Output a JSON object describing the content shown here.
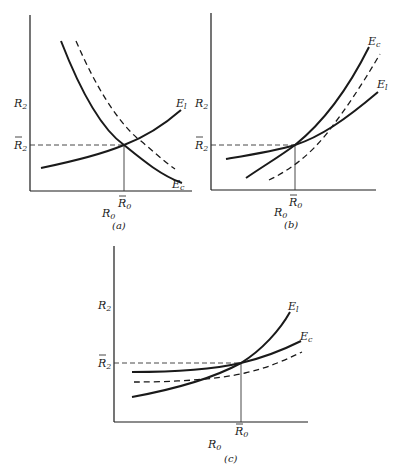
{
  "figure": {
    "panels": [
      {
        "id": "a",
        "caption": "(a)",
        "y_label": "R",
        "y_label_sub": "2",
        "y_tick_label": "R",
        "y_tick_sub": "2",
        "x_tick_label": "R",
        "x_tick_sub": "0",
        "x_label": "R",
        "x_label_sub": "0",
        "curves": [
          {
            "name": "E",
            "sub": "l",
            "style": "solid",
            "shape": "increasing convex"
          },
          {
            "name": "E",
            "sub": "c",
            "style": "solid",
            "shape": "decreasing convex"
          },
          {
            "name": "",
            "sub": "",
            "style": "dashed",
            "shape": "decreasing convex, shifted right of Ec"
          }
        ]
      },
      {
        "id": "b",
        "caption": "(b)",
        "y_label": "R",
        "y_label_sub": "2",
        "y_tick_label": "R",
        "y_tick_sub": "2",
        "x_tick_label": "R",
        "x_tick_sub": "0",
        "x_label": "R",
        "x_label_sub": "0",
        "curves": [
          {
            "name": "E",
            "sub": "c",
            "style": "solid",
            "shape": "increasing, steeper"
          },
          {
            "name": "E",
            "sub": "l",
            "style": "solid",
            "shape": "increasing, flatter"
          },
          {
            "name": "",
            "sub": "",
            "style": "dashed",
            "shape": "increasing, shifted right of Ec"
          }
        ]
      },
      {
        "id": "c",
        "caption": "(c)",
        "y_label": "R",
        "y_label_sub": "2",
        "y_tick_label": "R",
        "y_tick_sub": "2",
        "x_tick_label": "R",
        "x_tick_sub": "0",
        "x_label": "R",
        "x_label_sub": "0",
        "curves": [
          {
            "name": "E",
            "sub": "l",
            "style": "solid",
            "shape": "increasing, steeper"
          },
          {
            "name": "E",
            "sub": "c",
            "style": "solid",
            "shape": "increasing, flatter"
          },
          {
            "name": "",
            "sub": "",
            "style": "dashed",
            "shape": "flat-increasing, shifted below Ec"
          }
        ]
      }
    ]
  }
}
